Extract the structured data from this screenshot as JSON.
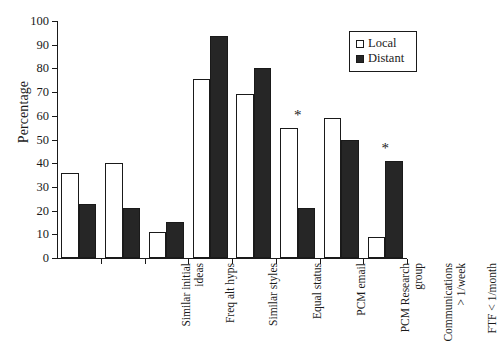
{
  "chart_data": {
    "type": "bar",
    "title": "",
    "xlabel": "",
    "ylabel": "Percentage",
    "ylim": [
      0,
      100
    ],
    "ytick_step": 10,
    "yticks": [
      100,
      90,
      80,
      70,
      60,
      50,
      40,
      30,
      20,
      10,
      0
    ],
    "grid": false,
    "legend_position": "top-right",
    "categories": [
      "Similar initial\nideas",
      "Freq alt hyps",
      "Similar styles",
      "Equal status",
      "PCM email",
      "PCM Research\ngroup",
      "Communications\n> 1/week",
      "FTF < 1/month"
    ],
    "series": [
      {
        "name": "Local",
        "color": "#ffffff",
        "values": [
          36,
          40,
          11,
          75.5,
          69,
          55,
          59,
          9
        ]
      },
      {
        "name": "Distant",
        "color": "#262626",
        "values": [
          23,
          21,
          15,
          93.5,
          80,
          21,
          50,
          41
        ]
      }
    ],
    "annotations": [
      {
        "symbol": "*",
        "category": "PCM Research\ngroup",
        "category_index": 5
      },
      {
        "symbol": "*",
        "category": "FTF < 1/month",
        "category_index": 7
      }
    ]
  },
  "legend": {
    "items": [
      {
        "label": "Local",
        "swatch": "open-square-swatch"
      },
      {
        "label": "Distant",
        "swatch": "filled-square-swatch"
      }
    ]
  }
}
